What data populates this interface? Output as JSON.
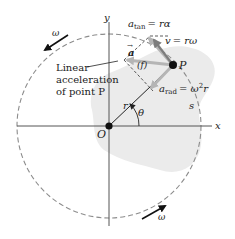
{
  "diagram": {
    "axes": {
      "x_label": "x",
      "y_label": "y",
      "origin_label": "O"
    },
    "point": {
      "label": "P"
    },
    "radius_label": "r",
    "angle_label": "θ",
    "arc_label": "s",
    "omega_labels": [
      "ω",
      "ω"
    ],
    "vectors": {
      "a_tan": {
        "symbol": "a",
        "subscript": "tan",
        "rhs": "= rα"
      },
      "v": {
        "symbol": "v",
        "rhs": "= rω"
      },
      "a_rad": {
        "symbol": "a",
        "subscript": "rad",
        "rhs": "= ω",
        "sup": "2",
        "tail": "r"
      },
      "a_total": {
        "symbol": "a",
        "arrow": "→",
        "magnitude_label": "(f)"
      }
    },
    "annotation": {
      "lines": [
        "Linear",
        "acceleration",
        "of point P"
      ]
    },
    "colors": {
      "body_fill": "#ebebeb",
      "dashed_circle": "#8c8c8c",
      "axis": "#555555",
      "vector_gray": "#b5b5b5",
      "velocity": "#7d7d7d",
      "point": "#111111"
    }
  }
}
